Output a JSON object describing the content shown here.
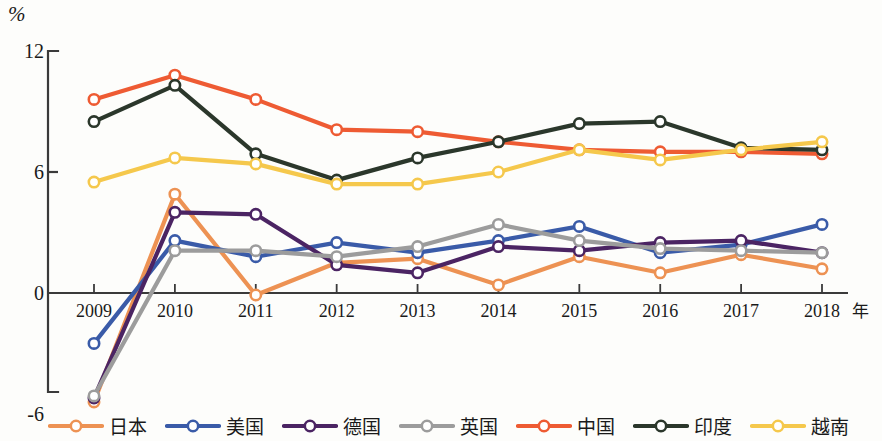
{
  "chart_data": {
    "type": "line",
    "title": "",
    "xlabel": "年",
    "ylabel": "%",
    "ylim": [
      -6,
      12
    ],
    "yticks": [
      12,
      6,
      0,
      -6
    ],
    "ytick_labels": [
      "12",
      "6",
      "0",
      "-6"
    ],
    "grid": false,
    "legend_position": "bottom",
    "categories": [
      "2009",
      "2010",
      "2011",
      "2012",
      "2013",
      "2014",
      "2015",
      "2016",
      "2017",
      "2018"
    ],
    "series": [
      {
        "name": "日本",
        "color": "#ED9253",
        "values": [
          -5.4,
          4.9,
          -0.1,
          1.5,
          1.7,
          0.4,
          1.8,
          1.0,
          1.9,
          1.2
        ]
      },
      {
        "name": "美国",
        "color": "#3A5BA8",
        "values": [
          -2.5,
          2.6,
          1.8,
          2.5,
          2.0,
          2.6,
          3.3,
          2.0,
          2.4,
          3.4
        ]
      },
      {
        "name": "德国",
        "color": "#4B2463",
        "values": [
          -5.2,
          4.0,
          3.9,
          1.4,
          1.0,
          2.3,
          2.1,
          2.5,
          2.6,
          2.0
        ]
      },
      {
        "name": "英国",
        "color": "#9C9C9C",
        "values": [
          -5.1,
          2.1,
          2.1,
          1.8,
          2.3,
          3.4,
          2.6,
          2.2,
          2.1,
          2.0
        ]
      },
      {
        "name": "中国",
        "color": "#EE5B33",
        "values": [
          9.6,
          10.8,
          9.6,
          8.1,
          8.0,
          7.5,
          7.1,
          7.0,
          7.0,
          6.9
        ]
      },
      {
        "name": "印度",
        "color": "#2B372B",
        "values": [
          8.5,
          10.3,
          6.9,
          5.6,
          6.7,
          7.5,
          8.4,
          8.5,
          7.2,
          7.1
        ]
      },
      {
        "name": "越南",
        "color": "#F5C84C",
        "values": [
          5.5,
          6.7,
          6.4,
          5.4,
          5.4,
          6.0,
          7.1,
          6.6,
          7.1,
          7.5
        ]
      }
    ]
  },
  "axes": {
    "y_unit": "%",
    "x_unit": "年"
  }
}
